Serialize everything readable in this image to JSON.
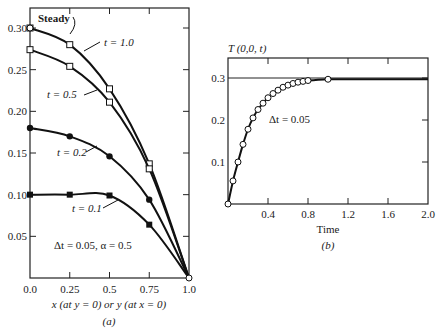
{
  "chart_data": [
    {
      "id": "a",
      "type": "line",
      "caption": "(a)",
      "xlabel": "x (at y = 0) or    y (at x = 0)",
      "ylabel": "",
      "xlim": [
        0.0,
        1.0
      ],
      "ylim": [
        0.0,
        0.32
      ],
      "x_ticks": [
        "0.0",
        "0.25",
        "0.5",
        "0.75",
        "1.0"
      ],
      "y_ticks": [
        "0.05",
        "0.10",
        "0.15",
        "0.20",
        "0.25",
        "0.30"
      ],
      "grid": false,
      "annotation": "Δt = 0.05,  α = 0.5",
      "series": [
        {
          "name": "Steady",
          "marker": "none",
          "x": [
            0,
            0.25,
            0.5,
            0.75,
            1.0
          ],
          "values": [
            0.3,
            0.281,
            0.228,
            0.138,
            0.0
          ]
        },
        {
          "name": "t = 1.0",
          "marker": "open-square",
          "x": [
            0,
            0.25,
            0.5,
            0.75,
            1.0
          ],
          "values": [
            0.3,
            0.28,
            0.227,
            0.137,
            0.0
          ]
        },
        {
          "name": "t = 0.5",
          "marker": "open-square",
          "x": [
            0,
            0.25,
            0.5,
            0.75,
            1.0
          ],
          "values": [
            0.274,
            0.254,
            0.211,
            0.131,
            0.0
          ]
        },
        {
          "name": "t = 0.2",
          "marker": "filled-circle",
          "x": [
            0,
            0.25,
            0.5,
            0.75,
            1.0
          ],
          "values": [
            0.18,
            0.17,
            0.146,
            0.094,
            0.0
          ]
        },
        {
          "name": "t = 0.1",
          "marker": "filled-square",
          "x": [
            0,
            0.25,
            0.5,
            0.75,
            1.0
          ],
          "values": [
            0.1,
            0.1,
            0.099,
            0.064,
            0.0
          ]
        }
      ],
      "labels": {
        "steady": "Steady",
        "t10": "t = 1.0",
        "t05": "t = 0.5",
        "t02": "t = 0.2",
        "t01": "t = 0.1"
      }
    },
    {
      "id": "b",
      "type": "line",
      "caption": "(b)",
      "title": "T (0,0, t)",
      "xlabel": "Time",
      "ylabel": "T (0,0, t)",
      "xlim": [
        0.0,
        2.0
      ],
      "ylim": [
        0.0,
        0.35
      ],
      "x_ticks": [
        "0.4",
        "0.8",
        "1.2",
        "1.6",
        "2.0"
      ],
      "y_ticks": [
        "0.1",
        "0.2",
        "0.3"
      ],
      "grid": false,
      "reference_line": 0.3,
      "annotation": "Δt = 0.05",
      "series": [
        {
          "name": "Δt = 0.05",
          "marker": "open-circle",
          "x": [
            0,
            0.05,
            0.1,
            0.15,
            0.2,
            0.25,
            0.3,
            0.35,
            0.4,
            0.45,
            0.5,
            0.55,
            0.6,
            0.65,
            0.7,
            0.75,
            0.8,
            1.0,
            2.0
          ],
          "values": [
            0.0,
            0.055,
            0.1,
            0.142,
            0.178,
            0.205,
            0.225,
            0.24,
            0.253,
            0.263,
            0.271,
            0.278,
            0.283,
            0.287,
            0.29,
            0.292,
            0.294,
            0.297,
            0.297
          ]
        }
      ]
    }
  ]
}
